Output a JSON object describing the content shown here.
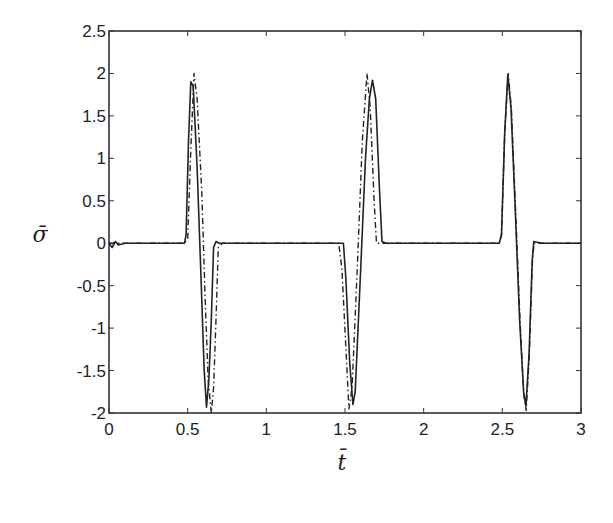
{
  "chart_data": {
    "type": "line",
    "title": "",
    "xlabel": "t̄",
    "ylabel": "σ̄",
    "xlim": [
      0,
      3
    ],
    "ylim": [
      -2,
      2.5
    ],
    "grid": false,
    "legend": null,
    "xticks": [
      "0",
      "0.5",
      "1",
      "1.5",
      "2",
      "2.5",
      "3"
    ],
    "yticks": [
      "-2",
      "-1.5",
      "-1",
      "-0.5",
      "0",
      "0.5",
      "1",
      "1.5",
      "2",
      "2.5"
    ],
    "series": [
      {
        "name": "solid",
        "style": "solid",
        "color": "#222222",
        "points": [
          [
            0.0,
            0.0
          ],
          [
            0.02,
            -0.05
          ],
          [
            0.04,
            0.02
          ],
          [
            0.06,
            -0.02
          ],
          [
            0.1,
            0.0
          ],
          [
            0.2,
            0.0
          ],
          [
            0.35,
            0.0
          ],
          [
            0.48,
            0.0
          ],
          [
            0.49,
            0.1
          ],
          [
            0.505,
            1.2
          ],
          [
            0.52,
            1.9
          ],
          [
            0.535,
            1.85
          ],
          [
            0.56,
            0.9
          ],
          [
            0.585,
            -0.4
          ],
          [
            0.605,
            -1.5
          ],
          [
            0.62,
            -1.93
          ],
          [
            0.635,
            -1.6
          ],
          [
            0.65,
            -0.9
          ],
          [
            0.665,
            -0.05
          ],
          [
            0.68,
            0.02
          ],
          [
            0.7,
            0.0
          ],
          [
            1.0,
            0.0
          ],
          [
            1.3,
            0.0
          ],
          [
            1.49,
            0.0
          ],
          [
            1.505,
            -0.4
          ],
          [
            1.53,
            -1.4
          ],
          [
            1.55,
            -1.9
          ],
          [
            1.565,
            -1.75
          ],
          [
            1.6,
            -0.3
          ],
          [
            1.63,
            1.0
          ],
          [
            1.655,
            1.7
          ],
          [
            1.675,
            1.92
          ],
          [
            1.695,
            1.7
          ],
          [
            1.72,
            0.6
          ],
          [
            1.735,
            0.02
          ],
          [
            1.76,
            0.0
          ],
          [
            2.0,
            0.0
          ],
          [
            2.48,
            0.0
          ],
          [
            2.495,
            0.1
          ],
          [
            2.515,
            1.3
          ],
          [
            2.535,
            1.98
          ],
          [
            2.555,
            1.6
          ],
          [
            2.58,
            0.5
          ],
          [
            2.61,
            -0.9
          ],
          [
            2.635,
            -1.75
          ],
          [
            2.65,
            -1.92
          ],
          [
            2.67,
            -1.3
          ],
          [
            2.69,
            -0.2
          ],
          [
            2.7,
            0.02
          ],
          [
            2.75,
            0.0
          ],
          [
            3.0,
            0.0
          ]
        ]
      },
      {
        "name": "dash-dot",
        "style": "dashdot",
        "color": "#222222",
        "points": [
          [
            0.0,
            0.0
          ],
          [
            0.48,
            0.0
          ],
          [
            0.5,
            0.05
          ],
          [
            0.52,
            1.1
          ],
          [
            0.54,
            2.0
          ],
          [
            0.56,
            1.7
          ],
          [
            0.59,
            0.6
          ],
          [
            0.61,
            -0.6
          ],
          [
            0.63,
            -1.6
          ],
          [
            0.65,
            -2.0
          ],
          [
            0.665,
            -1.7
          ],
          [
            0.68,
            -0.9
          ],
          [
            0.695,
            -0.05
          ],
          [
            0.72,
            0.0
          ],
          [
            1.0,
            0.0
          ],
          [
            1.46,
            0.0
          ],
          [
            1.48,
            -0.3
          ],
          [
            1.51,
            -1.4
          ],
          [
            1.525,
            -1.95
          ],
          [
            1.545,
            -1.7
          ],
          [
            1.58,
            -0.2
          ],
          [
            1.61,
            1.2
          ],
          [
            1.64,
            2.0
          ],
          [
            1.66,
            1.6
          ],
          [
            1.685,
            0.5
          ],
          [
            1.7,
            0.0
          ],
          [
            1.75,
            0.0
          ],
          [
            2.0,
            0.0
          ],
          [
            2.48,
            0.0
          ],
          [
            2.495,
            0.1
          ],
          [
            2.515,
            1.3
          ],
          [
            2.537,
            2.0
          ],
          [
            2.557,
            1.6
          ],
          [
            2.582,
            0.5
          ],
          [
            2.612,
            -0.9
          ],
          [
            2.637,
            -1.8
          ],
          [
            2.652,
            -1.97
          ],
          [
            2.672,
            -1.3
          ],
          [
            2.692,
            -0.2
          ],
          [
            2.702,
            0.0
          ],
          [
            3.0,
            0.0
          ]
        ]
      }
    ]
  },
  "axes": {
    "x_label": "t̄",
    "y_label": "σ̄"
  }
}
